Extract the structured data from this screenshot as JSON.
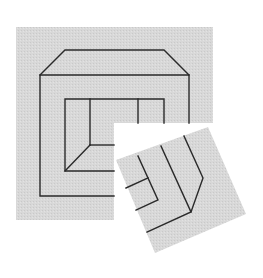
{
  "figure": {
    "colors": {
      "background": "#ffffff",
      "panel_fill": "#d6d6d6",
      "line": "#2a2a2a"
    },
    "main_panel": {
      "x": 16,
      "y": 27,
      "width": 197,
      "height": 193,
      "cutout": {
        "x": 114,
        "y": 123,
        "width": 99,
        "height": 97
      }
    },
    "rotated_piece": {
      "corners": [
        [
          116,
          160
        ],
        [
          208,
          127
        ],
        [
          246,
          214
        ],
        [
          155,
          253
        ]
      ]
    }
  }
}
